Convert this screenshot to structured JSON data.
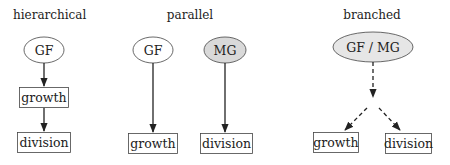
{
  "panels": [
    {
      "title": "hierarchical",
      "nodes": [
        {
          "id": "gf",
          "label": "GF",
          "shape": "ellipse",
          "fill": "#ffffff"
        },
        {
          "id": "growth",
          "label": "growth",
          "shape": "box"
        },
        {
          "id": "division",
          "label": "division",
          "shape": "box"
        }
      ],
      "edges": [
        {
          "from": "gf",
          "to": "growth",
          "style": "solid"
        },
        {
          "from": "growth",
          "to": "division",
          "style": "solid"
        }
      ]
    },
    {
      "title": "parallel",
      "nodes": [
        {
          "id": "gf",
          "label": "GF",
          "shape": "ellipse",
          "fill": "#ffffff"
        },
        {
          "id": "mg",
          "label": "MG",
          "shape": "ellipse",
          "fill": "#d9d9d9"
        },
        {
          "id": "growth",
          "label": "growth",
          "shape": "box"
        },
        {
          "id": "division",
          "label": "division",
          "shape": "box"
        }
      ],
      "edges": [
        {
          "from": "gf",
          "to": "growth",
          "style": "solid"
        },
        {
          "from": "mg",
          "to": "division",
          "style": "solid"
        }
      ]
    },
    {
      "title": "branched",
      "nodes": [
        {
          "id": "gfmg",
          "label": "GF / MG",
          "shape": "ellipse",
          "fill": "#e6e6e6"
        },
        {
          "id": "growth",
          "label": "growth",
          "shape": "box"
        },
        {
          "id": "division",
          "label": "division",
          "shape": "box"
        }
      ],
      "edges": [
        {
          "from": "gfmg",
          "to": "branch-point",
          "style": "dashed"
        },
        {
          "from": "branch-point",
          "to": "growth",
          "style": "dashed"
        },
        {
          "from": "branch-point",
          "to": "division",
          "style": "dashed"
        }
      ]
    }
  ]
}
